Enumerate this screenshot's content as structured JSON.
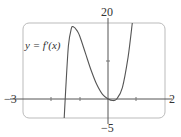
{
  "chart_data": {
    "type": "line",
    "title": "",
    "series": [
      {
        "name": "y = f'(x)",
        "x": [
          -1.55,
          -1.5,
          -1.4,
          -1.3,
          -1.23,
          -1.1,
          -1.0,
          -0.8,
          -0.6,
          -0.4,
          -0.2,
          0.0,
          0.15,
          0.3,
          0.5,
          0.7,
          0.85
        ],
        "y": [
          -5,
          2,
          14,
          18.5,
          19,
          18,
          16.5,
          12,
          7.5,
          3.8,
          1.2,
          0,
          -0.4,
          0,
          3,
          11,
          20
        ]
      }
    ],
    "xlabel": "",
    "ylabel": "",
    "xlim": [
      -3,
      2
    ],
    "ylim": [
      -5,
      20
    ],
    "tick_labels": {
      "x_min": "−3",
      "x_max": "2",
      "y_max": "20",
      "y_min": "−5"
    },
    "curve_label": "y = f′(x)",
    "grid": false,
    "legend": "none"
  }
}
